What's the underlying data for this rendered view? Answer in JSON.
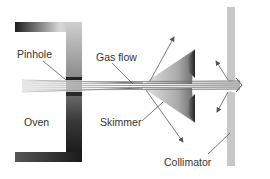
{
  "diagram": {
    "labels": {
      "pinhole": "Pinhole",
      "gas_flow": "Gas flow",
      "oven": "Oven",
      "skimmer": "Skimmer",
      "collimator": "Collimator"
    },
    "components": [
      "oven",
      "pinhole",
      "gas-flow-beam",
      "skimmer",
      "collimator"
    ],
    "colors": {
      "oven_dark": "#1a1a1a",
      "oven_light": "#9a9a9a",
      "collimator": "#c8c8c8",
      "arrow": "#6e6e6e",
      "beam": "#7a7a7a",
      "text": "#333333"
    }
  }
}
